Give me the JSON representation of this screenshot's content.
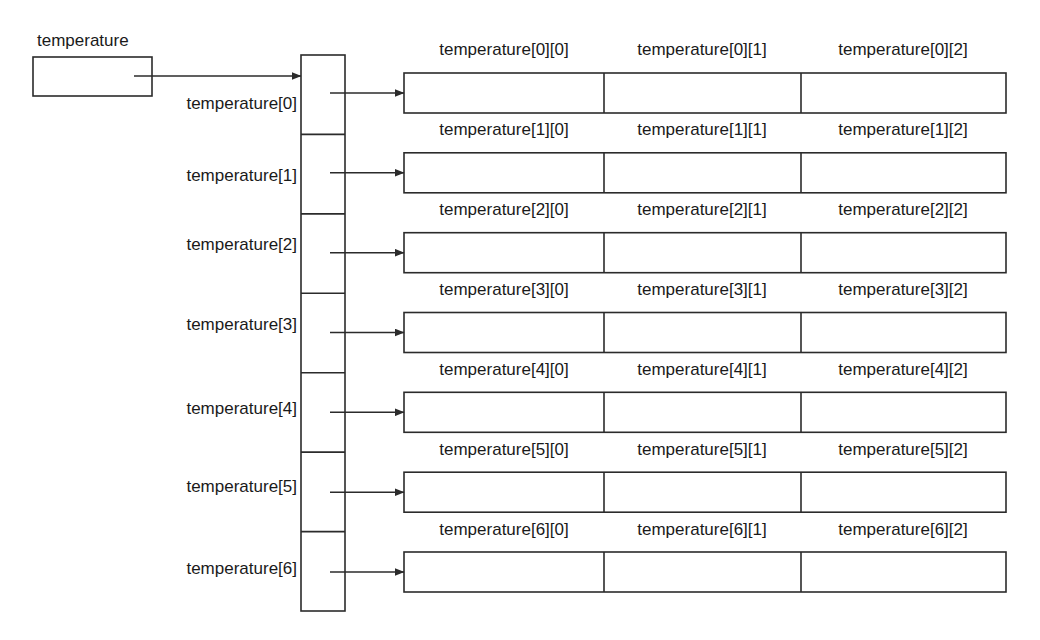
{
  "diagram": {
    "title_label": "temperature",
    "pointer_labels": [
      "temperature[0]",
      "temperature[1]",
      "temperature[2]",
      "temperature[3]",
      "temperature[4]",
      "temperature[5]",
      "temperature[6]"
    ],
    "row_cell_labels": [
      [
        "temperature[0][0]",
        "temperature[0][1]",
        "temperature[0][2]"
      ],
      [
        "temperature[1][0]",
        "temperature[1][1]",
        "temperature[1][2]"
      ],
      [
        "temperature[2][0]",
        "temperature[2][1]",
        "temperature[2][2]"
      ],
      [
        "temperature[3][0]",
        "temperature[3][1]",
        "temperature[3][2]"
      ],
      [
        "temperature[4][0]",
        "temperature[4][1]",
        "temperature[4][2]"
      ],
      [
        "temperature[5][0]",
        "temperature[5][1]",
        "temperature[5][2]"
      ],
      [
        "temperature[6][0]",
        "temperature[6][1]",
        "temperature[6][2]"
      ]
    ],
    "colors": {
      "stroke": "#2b2b2b",
      "fill": "#ffffff",
      "text": "#1a1a1a"
    }
  }
}
